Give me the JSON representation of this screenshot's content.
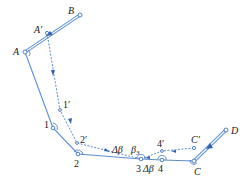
{
  "diagram": {
    "type": "traverse-adjustment",
    "colors": {
      "line": "#5a8fd0",
      "dashed": "#4a7fc8",
      "text": "#1a1a1a",
      "background": "#ffffff"
    },
    "points": {
      "B": {
        "label": "B",
        "x": 80,
        "y": 15
      },
      "A": {
        "label": "A",
        "x": 25,
        "y": 52
      },
      "A_prime": {
        "label": "A′",
        "x": 47,
        "y": 33
      },
      "p1": {
        "label": "1",
        "x": 53,
        "y": 128
      },
      "p1_prime": {
        "label": "1′",
        "x": 60,
        "y": 110
      },
      "p2": {
        "label": "2",
        "x": 78,
        "y": 154
      },
      "p2_prime": {
        "label": "2′",
        "x": 77,
        "y": 143
      },
      "p3": {
        "label": "3",
        "x": 141,
        "y": 159
      },
      "p4": {
        "label": "4",
        "x": 162,
        "y": 160
      },
      "p4_prime": {
        "label": "4′",
        "x": 162,
        "y": 151
      },
      "C": {
        "label": "C",
        "x": 194,
        "y": 161
      },
      "C_prime": {
        "label": "C′",
        "x": 194,
        "y": 148
      },
      "D": {
        "label": "D",
        "x": 226,
        "y": 130
      }
    },
    "annotations": {
      "delta_beta_upper": "Δβ",
      "beta3": "β",
      "beta3_sub": "3",
      "delta_beta_lower": "Δβ"
    }
  }
}
